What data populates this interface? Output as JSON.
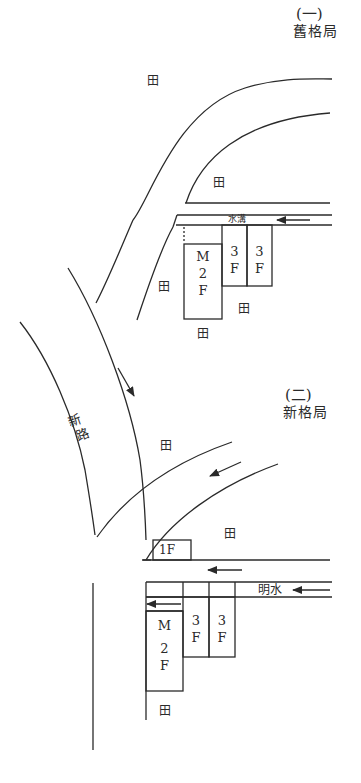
{
  "diagram": {
    "old_layout": {
      "number": "(一)",
      "title": "舊格局",
      "fields": [
        "田",
        "田",
        "田",
        "田",
        "田"
      ],
      "ditch_label": "水溝",
      "buildings": [
        {
          "line1": "M",
          "line2": "2",
          "line3": "F"
        },
        {
          "line1": "3",
          "line2": "F"
        },
        {
          "line1": "3",
          "line2": "F"
        }
      ]
    },
    "road": {
      "label_line1": "新",
      "label_line2": "路"
    },
    "new_layout": {
      "number": "(二)",
      "title": "新格局",
      "fields": [
        "田",
        "田",
        "田"
      ],
      "water_label": "明水",
      "small_building": "1F",
      "buildings": [
        {
          "line1": "M",
          "line2": "2",
          "line3": "F"
        },
        {
          "line1": "3",
          "line2": "F"
        },
        {
          "line1": "3",
          "line2": "F"
        }
      ]
    },
    "colors": {
      "line": "#2a2a2a",
      "background": "#ffffff"
    }
  }
}
